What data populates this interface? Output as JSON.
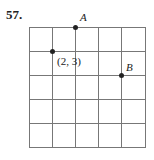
{
  "problem": {
    "number": "57.",
    "grid": {
      "columns": 5,
      "rows": 5,
      "line_color": "#777777"
    },
    "points": [
      {
        "id": "given",
        "label": "(2, 3)"
      },
      {
        "id": "A",
        "label": "A"
      },
      {
        "id": "B",
        "label": "B"
      }
    ]
  }
}
